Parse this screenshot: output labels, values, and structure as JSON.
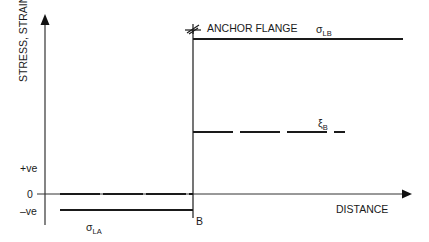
{
  "axes": {
    "y_label": "STRESS, STRAIN",
    "x_label": "DISTANCE",
    "y_ticks": [
      "+ve",
      "0",
      "–ve"
    ]
  },
  "annotations": {
    "anchor": "ANCHOR FLANGE",
    "point_b": "B",
    "sigma_lb": {
      "symbol": "σ",
      "sub": "LB"
    },
    "xi_b": {
      "symbol": "ξ",
      "sub": "B"
    },
    "sigma_la": {
      "symbol": "σ",
      "sub": "LA"
    }
  },
  "colors": {
    "line": "#1a1a1a",
    "axis": "#333333"
  }
}
